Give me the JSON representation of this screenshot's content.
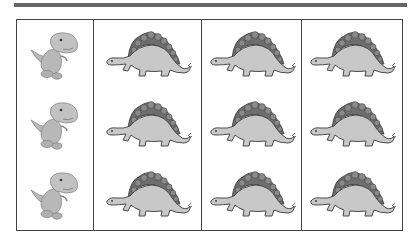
{
  "worksheet": {
    "top_rule_color": "#666666",
    "border_color": "#444444",
    "rows": 3,
    "columns": [
      {
        "icon": "baby-trex-icon",
        "count_per_column": 3,
        "alt": "baby dinosaur"
      },
      {
        "icon": "stegosaurus-icon",
        "count_per_column": 3,
        "alt": "stegosaurus"
      },
      {
        "icon": "stegosaurus-icon",
        "count_per_column": 3,
        "alt": "stegosaurus"
      },
      {
        "icon": "stegosaurus-icon",
        "count_per_column": 3,
        "alt": "stegosaurus"
      }
    ],
    "colors": {
      "body": "#c8c8c8",
      "plates": "#6e6e6e",
      "outline": "#4a4a4a",
      "trex_body": "#b8b8b8"
    }
  }
}
